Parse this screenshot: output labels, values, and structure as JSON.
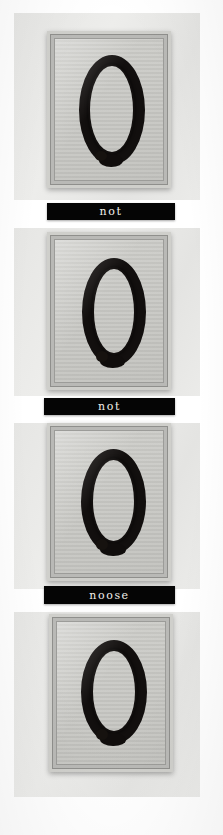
{
  "image": {
    "title": "Framed Rope Loop Series",
    "medium": "photograph of four framed artworks on a gallery wall",
    "orientation": "vertical strip",
    "background_color": "#ffffff",
    "wall_color": "#e9e9e7",
    "mat_color": "#c8c8c5",
    "frame_color": "#cfcfcb",
    "rope_color": "#120f0e",
    "plate_background": "#050505",
    "plate_text_color": "#f2f0ea"
  },
  "panels": [
    {
      "index": 1,
      "subject": "dark rope tied into a vertical oval loop with a knot at the lower centre",
      "caption": "not",
      "has_caption": true
    },
    {
      "index": 2,
      "subject": "dark rope tied into a vertical oval loop with a knot at the lower centre",
      "caption": "not",
      "has_caption": true
    },
    {
      "index": 3,
      "subject": "dark rope tied into a vertical oval loop with a knot at the lower centre",
      "caption": "noose",
      "has_caption": true
    },
    {
      "index": 4,
      "subject": "dark rope tied into a vertical oval loop with a knot at the lower centre",
      "caption": "",
      "has_caption": false
    }
  ],
  "captions": {
    "plate_1": "not",
    "plate_2": "not",
    "plate_3": "noose"
  },
  "footer": {
    "faint_mark": ""
  }
}
